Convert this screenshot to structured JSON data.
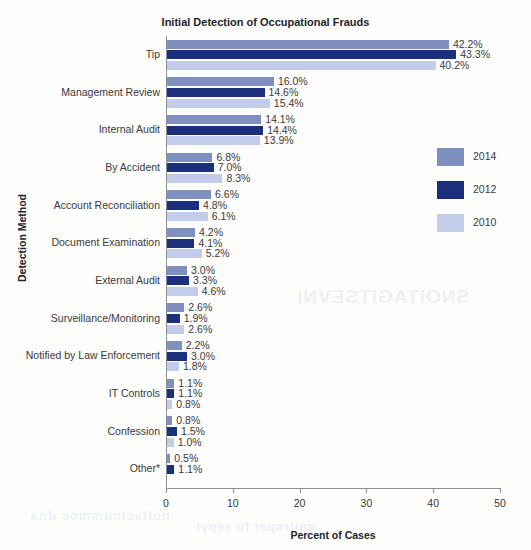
{
  "chart_data": {
    "type": "bar",
    "orientation": "horizontal",
    "title": "Initial Detection of Occupational Frauds",
    "xlabel": "Percent of Cases",
    "ylabel": "Detection Method",
    "xlim": [
      0,
      50
    ],
    "xticks": [
      0,
      10,
      20,
      30,
      40,
      50
    ],
    "grid": false,
    "legend_position": "right",
    "categories": [
      "Tip",
      "Management Review",
      "Internal Audit",
      "By Accident",
      "Account Reconciliation",
      "Document Examination",
      "External Audit",
      "Surveillance/Monitoring",
      "Notified by Law Enforcement",
      "IT Controls",
      "Confession",
      "Other*"
    ],
    "series": [
      {
        "name": "2014",
        "color": "#7f8fc0",
        "values": [
          42.2,
          16.0,
          14.1,
          6.8,
          6.6,
          4.2,
          3.0,
          2.6,
          2.2,
          1.1,
          0.8,
          0.5
        ],
        "labels": [
          "42.2%",
          "16.0%",
          "14.1%",
          "6.8%",
          "6.6%",
          "4.2%",
          "3.0%",
          "2.6%",
          "2.2%",
          "1.1%",
          "0.8%",
          "0.5%"
        ]
      },
      {
        "name": "2012",
        "color": "#1c2f7c",
        "values": [
          43.3,
          14.6,
          14.4,
          7.0,
          4.8,
          4.1,
          3.3,
          1.9,
          3.0,
          1.1,
          1.5,
          1.1
        ],
        "labels": [
          "43.3%",
          "14.6%",
          "14.4%",
          "7.0%",
          "4.8%",
          "4.1%",
          "3.3%",
          "1.9%",
          "3.0%",
          "1.1%",
          "1.5%",
          "1.1%"
        ]
      },
      {
        "name": "2010",
        "color": "#c3cce8",
        "values": [
          40.2,
          15.4,
          13.9,
          8.3,
          6.1,
          5.2,
          4.6,
          2.6,
          1.8,
          0.8,
          1.0,
          null
        ],
        "labels": [
          "40.2%",
          "15.4%",
          "13.9%",
          "8.3%",
          "6.1%",
          "5.2%",
          "4.6%",
          "2.6%",
          "1.8%",
          "0.8%",
          "1.0%",
          null
        ]
      }
    ]
  },
  "bleed_through": {
    "line1": "SNOITAGITSEVNI",
    "line2": "noitacinummoc dna",
    "line3": "gnitroper fo sepyt"
  }
}
